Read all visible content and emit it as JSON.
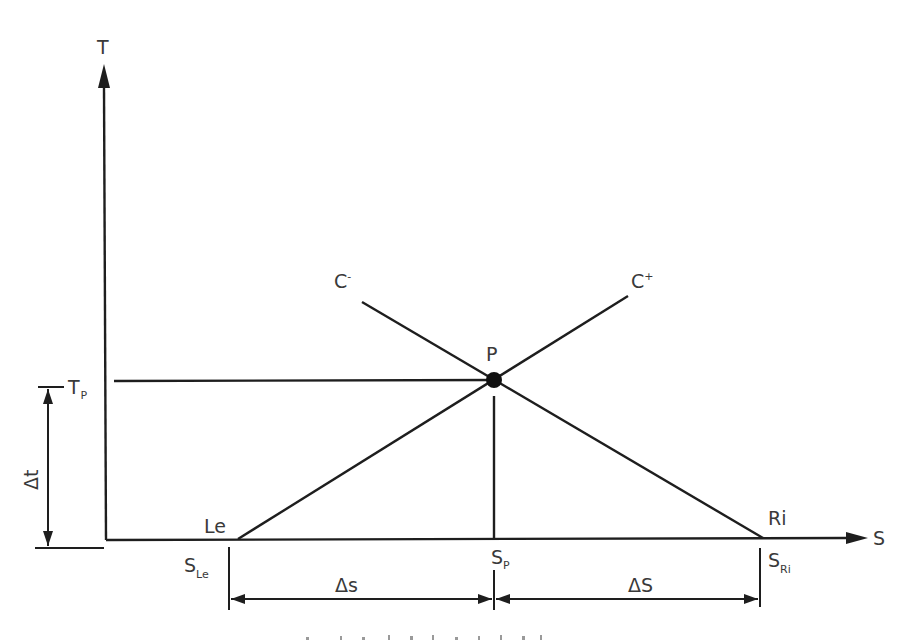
{
  "diagram": {
    "axes": {
      "y_label": "T",
      "x_label": "S"
    },
    "points": {
      "P": {
        "label": "P"
      },
      "Le": {
        "label": "Le"
      },
      "Ri": {
        "label": "Ri"
      }
    },
    "curves": {
      "c_minus": {
        "base": "C",
        "sup": "-"
      },
      "c_plus": {
        "base": "C",
        "sup": "+"
      }
    },
    "ticks": {
      "t_p": {
        "base": "T",
        "sub": "P"
      },
      "s_le": {
        "base": "S",
        "sub": "Le"
      },
      "s_p": {
        "base": "S",
        "sub": "P"
      },
      "s_ri": {
        "base": "S",
        "sub": "Ri"
      }
    },
    "dimensions": {
      "delta_t": "Δt",
      "delta_s_left": "Δs",
      "delta_s_right": "ΔS"
    },
    "caption_fragment": ""
  }
}
